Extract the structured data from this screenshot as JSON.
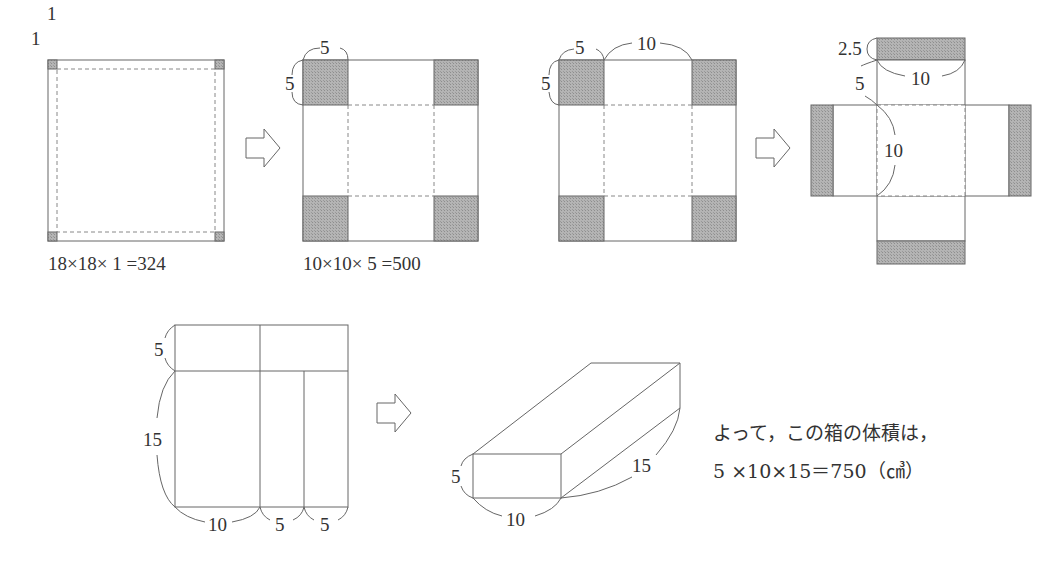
{
  "colors": {
    "line": "#555555",
    "shade": "#aaaaaa",
    "dash": "#777777",
    "text": "#333333"
  },
  "figure1": {
    "side_label": "1",
    "top_label": "1",
    "caption": "18×18× 1 =324"
  },
  "figure2": {
    "top_label": "5",
    "side_label": "5",
    "caption": "10×10× 5 =500"
  },
  "figure3": {
    "corner_top_label": "5",
    "corner_side_label": "5",
    "middle_label": "10"
  },
  "figure4": {
    "flap_label": "2.5",
    "flap_width_label": "10",
    "side_label": "5",
    "base_label": "10"
  },
  "figure5": {
    "top_height_label": "5",
    "height_label": "15",
    "bottom_labels": [
      "10",
      "5",
      "5"
    ]
  },
  "figure6": {
    "height_label": "5",
    "width_label": "10",
    "depth_label": "15"
  },
  "conclusion": {
    "line1": "よって，この箱の体積は，",
    "line2": "5 ×10×15＝750（㎤）"
  }
}
